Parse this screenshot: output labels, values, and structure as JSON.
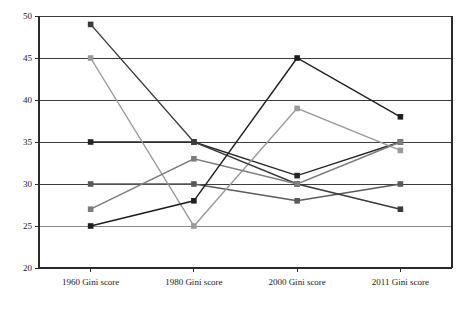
{
  "chart_data": {
    "type": "line",
    "title": "",
    "subtitle": "",
    "xlabel": "",
    "ylabel": "",
    "categories": [
      "1960 Gini score",
      "1980 Gini score",
      "2000 Gini score",
      "2011 Gini score"
    ],
    "ylim": [
      20,
      50
    ],
    "yticks": [
      20,
      25,
      30,
      35,
      40,
      45,
      50
    ],
    "ytick_labels": [
      "20",
      "25",
      "30",
      "35",
      "40",
      "45",
      "50"
    ],
    "grid": true,
    "grid_axis": "y",
    "legend_position": "bottom",
    "marker": "square",
    "series": [
      {
        "name": "Belgium",
        "color": "#262626",
        "values": [
          35,
          35,
          31,
          35
        ]
      },
      {
        "name": "Germany",
        "color": "#5a5a5a",
        "values": [
          30,
          30,
          28,
          30
        ]
      },
      {
        "name": "UK",
        "color": "#9a9a9a",
        "values": [
          45,
          25,
          39,
          34
        ]
      },
      {
        "name": "France",
        "color": "#3a3a3a",
        "values": [
          49,
          35,
          30,
          27
        ]
      },
      {
        "name": "Italy",
        "color": "#7d7d7d",
        "values": [
          27,
          33,
          30,
          35
        ]
      },
      {
        "name": "United States",
        "color": "#1f1f1f",
        "values": [
          25,
          28,
          45,
          38
        ]
      }
    ]
  },
  "legend": {
    "items": [
      {
        "label": "Belgium"
      },
      {
        "label": "Germany"
      },
      {
        "label": "UK"
      },
      {
        "label": "France"
      },
      {
        "label": "Italy"
      },
      {
        "label": "United States"
      }
    ]
  },
  "colors": {
    "background": "#ffffff",
    "axis": "#2a2a2a",
    "gridline": "#555555",
    "text": "#1a1a1a"
  }
}
